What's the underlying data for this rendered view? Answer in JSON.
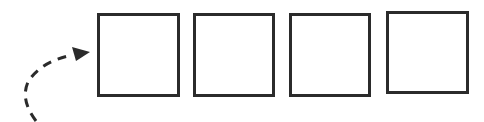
{
  "diagram": {
    "stroke_color": "#2b2b2b",
    "background": "#ffffff",
    "boxes": [
      {
        "id": "box-1",
        "x": 97,
        "y": 13,
        "w": 83,
        "h": 84
      },
      {
        "id": "box-2",
        "x": 193,
        "y": 13,
        "w": 82,
        "h": 84
      },
      {
        "id": "box-3",
        "x": 289,
        "y": 13,
        "w": 82,
        "h": 84
      },
      {
        "id": "box-4",
        "x": 386,
        "y": 11,
        "w": 83,
        "h": 83
      }
    ],
    "arrow": {
      "style": "dashed",
      "direction": "into first box",
      "icon": "curved-dashed-arrow-icon"
    }
  }
}
